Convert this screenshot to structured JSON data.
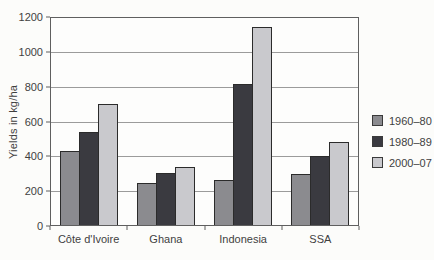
{
  "figure": {
    "background": "#fcfcfa",
    "text_color": "#3f3f3f"
  },
  "chart_data": {
    "type": "bar",
    "title": "",
    "xlabel": "",
    "ylabel": "Yields in kg/ha",
    "ylim": [
      0,
      1200
    ],
    "yticks": [
      0,
      200,
      400,
      600,
      800,
      1000,
      1200
    ],
    "grid": true,
    "legend_position": "right",
    "categories": [
      "Côte d'Ivoire",
      "Ghana",
      "Indonesia",
      "SSA"
    ],
    "series": [
      {
        "name": "1960–80",
        "color": "#8b8b8f",
        "values": [
          430,
          245,
          260,
          295
        ]
      },
      {
        "name": "1980–89",
        "color": "#3a3a40",
        "values": [
          540,
          300,
          820,
          400
        ]
      },
      {
        "name": "2000–07",
        "color": "#c9c9cd",
        "values": [
          700,
          335,
          1150,
          480
        ]
      }
    ],
    "bar_border_color": "#2b2b2b",
    "grid_color": "#9b9b9b",
    "axis_color": "#5f5f5f"
  }
}
